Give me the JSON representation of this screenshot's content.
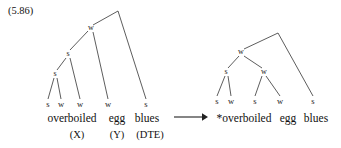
{
  "figure": {
    "example_number": "(5.86)",
    "ink_color": "#222222"
  },
  "arrow": {
    "glyph": "⟶",
    "name": "rightwards-arrow",
    "x1": 175,
    "y1": 117,
    "x2": 207,
    "y2": 117
  },
  "left_tree": {
    "name": "input-metrical-tree",
    "apex": {
      "x": 118,
      "y": 11
    },
    "internal_nodes": [
      {
        "id": "w-top",
        "label": "w",
        "x": 91,
        "y": 28
      },
      {
        "id": "s-mid",
        "label": "s",
        "x": 68,
        "y": 54
      },
      {
        "id": "s-low",
        "label": "s",
        "x": 55,
        "y": 74
      }
    ],
    "leaves": [
      {
        "label": "s",
        "x": 48,
        "y": 104
      },
      {
        "label": "w",
        "x": 61,
        "y": 104
      },
      {
        "label": "w",
        "x": 80,
        "y": 104
      },
      {
        "label": "w",
        "x": 108,
        "y": 104
      },
      {
        "label": "s",
        "x": 146,
        "y": 104
      }
    ],
    "words": [
      {
        "text": "overboiled",
        "x": 72,
        "y": 118
      },
      {
        "text": "egg",
        "x": 117,
        "y": 118
      },
      {
        "text": "blues",
        "x": 147,
        "y": 118
      }
    ],
    "annotations": [
      {
        "text": "(X)",
        "x": 77,
        "y": 134
      },
      {
        "text": "(Y)",
        "x": 117,
        "y": 134
      },
      {
        "text": "(DTE)",
        "x": 150,
        "y": 134
      }
    ]
  },
  "right_tree": {
    "name": "output-metrical-tree",
    "apex": {
      "x": 278,
      "y": 33
    },
    "internal_nodes": [
      {
        "id": "w-top",
        "label": "w",
        "x": 241,
        "y": 52
      },
      {
        "id": "s-left",
        "label": "s",
        "x": 226,
        "y": 72
      },
      {
        "id": "w-right",
        "label": "w",
        "x": 264,
        "y": 72
      }
    ],
    "leaves": [
      {
        "label": "s",
        "x": 217,
        "y": 101
      },
      {
        "label": "w",
        "x": 231,
        "y": 101
      },
      {
        "label": "s",
        "x": 255,
        "y": 101
      },
      {
        "label": "w",
        "x": 280,
        "y": 101
      },
      {
        "label": "s",
        "x": 313,
        "y": 101
      }
    ],
    "words": [
      {
        "text": "*overboiled",
        "x": 244,
        "y": 118
      },
      {
        "text": "egg",
        "x": 288,
        "y": 118
      },
      {
        "text": "blues",
        "x": 316,
        "y": 118
      }
    ],
    "annotations": []
  },
  "left_edges": [
    {
      "from": "apex",
      "to": "w-top",
      "x1": 118,
      "y1": 11,
      "x2": 93,
      "y2": 25
    },
    {
      "from": "apex",
      "to": "leaf-5",
      "x1": 118,
      "y1": 11,
      "x2": 146,
      "y2": 99
    },
    {
      "from": "w-top",
      "to": "s-mid",
      "x1": 88,
      "y1": 31,
      "x2": 70,
      "y2": 50
    },
    {
      "from": "w-top",
      "to": "leaf-4",
      "x1": 93,
      "y1": 32,
      "x2": 108,
      "y2": 99
    },
    {
      "from": "s-mid",
      "to": "s-low",
      "x1": 66,
      "y1": 58,
      "x2": 57,
      "y2": 70
    },
    {
      "from": "s-mid",
      "to": "leaf-3",
      "x1": 70,
      "y1": 58,
      "x2": 80,
      "y2": 99
    },
    {
      "from": "s-low",
      "to": "leaf-1",
      "x1": 54,
      "y1": 78,
      "x2": 48,
      "y2": 99
    },
    {
      "from": "s-low",
      "to": "leaf-2",
      "x1": 57,
      "y1": 78,
      "x2": 61,
      "y2": 99
    }
  ],
  "right_edges": [
    {
      "from": "apex",
      "to": "w-top",
      "x1": 278,
      "y1": 33,
      "x2": 244,
      "y2": 49
    },
    {
      "from": "apex",
      "to": "leaf-5",
      "x1": 278,
      "y1": 33,
      "x2": 313,
      "y2": 96
    },
    {
      "from": "w-top",
      "to": "s-left",
      "x1": 239,
      "y1": 56,
      "x2": 228,
      "y2": 68
    },
    {
      "from": "w-top",
      "to": "w-right",
      "x1": 244,
      "y1": 56,
      "x2": 262,
      "y2": 68
    },
    {
      "from": "s-left",
      "to": "leaf-1",
      "x1": 225,
      "y1": 76,
      "x2": 217,
      "y2": 96
    },
    {
      "from": "s-left",
      "to": "leaf-2",
      "x1": 228,
      "y1": 76,
      "x2": 231,
      "y2": 96
    },
    {
      "from": "w-right",
      "to": "leaf-3",
      "x1": 262,
      "y1": 76,
      "x2": 255,
      "y2": 96
    },
    {
      "from": "w-right",
      "to": "leaf-4",
      "x1": 266,
      "y1": 76,
      "x2": 280,
      "y2": 96
    }
  ]
}
